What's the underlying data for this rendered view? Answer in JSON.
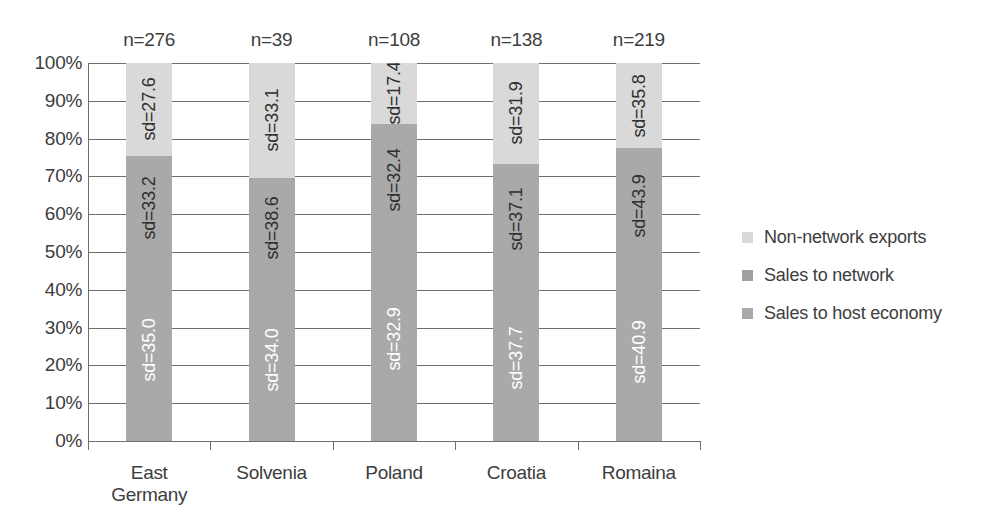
{
  "chart_data": {
    "type": "bar",
    "subtype": "stacked-100-percent",
    "title": "",
    "xlabel": "",
    "ylabel": "",
    "ylim": [
      0,
      100
    ],
    "ytick_labels": [
      "100%",
      "90%",
      "80%",
      "70%",
      "60%",
      "50%",
      "40%",
      "30%",
      "20%",
      "10%",
      "0%"
    ],
    "ytick_values": [
      100,
      90,
      80,
      70,
      60,
      50,
      40,
      30,
      20,
      10,
      0
    ],
    "grid": true,
    "legend_position": "right",
    "categories": [
      "East Germany",
      "Solvenia",
      "Poland",
      "Croatia",
      "Romaina"
    ],
    "category_notes": [
      "n=276",
      "n=39",
      "n=108",
      "n=138",
      "n=219"
    ],
    "series": [
      {
        "name": "Sales to host economy",
        "color": "#a9a9a9",
        "values": [
          48.0,
          43.0,
          54.0,
          44.0,
          47.0
        ],
        "labels": [
          "sd=35.0",
          "sd=34.0",
          "sd=32.9",
          "sd=37.7",
          "sd=40.9"
        ]
      },
      {
        "name": "Sales to network",
        "color": "#a9a9a9",
        "values": [
          27.5,
          26.6,
          29.9,
          29.3,
          30.5
        ],
        "labels": [
          "sd=33.2",
          "sd=38.6",
          "sd=32.4",
          "sd=37.1",
          "sd=43.9"
        ]
      },
      {
        "name": "Non-network exports",
        "color": "#d9d9d9",
        "values": [
          24.5,
          30.4,
          16.1,
          26.7,
          22.5
        ],
        "labels": [
          "sd=27.6",
          "sd=33.1",
          "sd=17.4",
          "sd=31.9",
          "sd=35.8"
        ]
      }
    ],
    "stack_boundaries_percent": [
      {
        "category": "East Germany",
        "host_economy_top": 48.0,
        "network_top": 75.5
      },
      {
        "category": "Solvenia",
        "host_economy_top": 43.0,
        "network_top": 69.6
      },
      {
        "category": "Poland",
        "host_economy_top": 54.0,
        "network_top": 83.9
      },
      {
        "category": "Croatia",
        "host_economy_top": 44.0,
        "network_top": 73.3
      },
      {
        "category": "Romaina",
        "host_economy_top": 47.0,
        "network_top": 77.5
      }
    ]
  },
  "legend": {
    "items": [
      {
        "label": "Non-network exports",
        "color": "#d9d9d9"
      },
      {
        "label": "Sales to network",
        "color": "#a0a0a0"
      },
      {
        "label": "Sales to host economy",
        "color": "#a9a9a9"
      }
    ]
  },
  "colors": {
    "axis": "#6f6f6f",
    "text": "#3d3d3d",
    "light_gray": "#d9d9d9",
    "mid_gray": "#a9a9a9",
    "label_light": "#ffffff",
    "background": "#ffffff"
  }
}
